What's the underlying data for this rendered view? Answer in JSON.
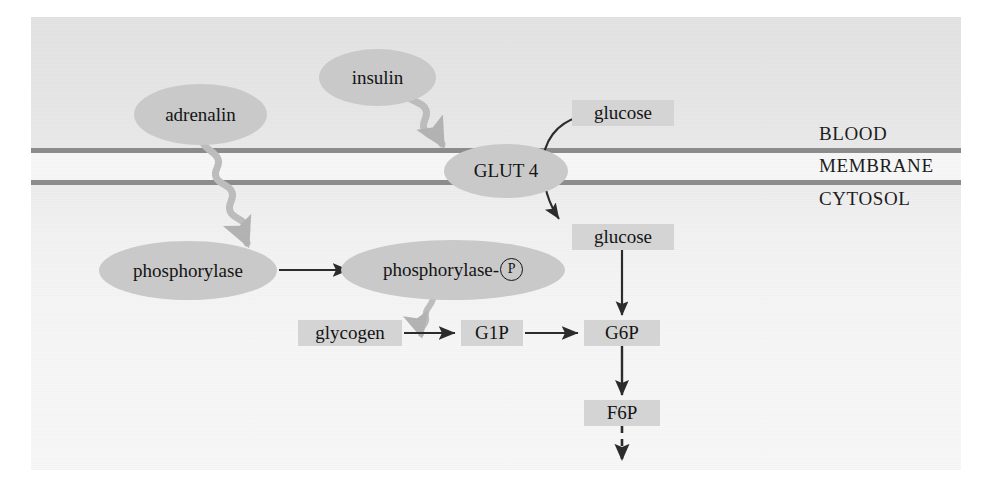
{
  "figure": {
    "type": "biological-pathway-diagram",
    "background_gradient_top": "#e3e3e3",
    "background_gradient_bottom": "#f7f7f7",
    "node_fill": "#c9c9c9",
    "box_fill": "#d4d4d4",
    "membrane_color": "#8c8c8c",
    "text_color": "#141414",
    "wavy_arrow_color": "#bdbdbd",
    "solid_arrow_color": "#2b2b2b"
  },
  "compartments": {
    "blood": "BLOOD",
    "membrane": "MEMBRANE",
    "cytosol": "CYTOSOL"
  },
  "nodes": {
    "adrenalin": "adrenalin",
    "insulin": "insulin",
    "glut4": "GLUT 4",
    "phosphorylase": "phosphorylase",
    "phosphorylase_p_prefix": "phosphorylase-",
    "phosphorylase_p_marker": "P"
  },
  "metabolites": {
    "glucose_blood": "glucose",
    "glucose_cytosol": "glucose",
    "glycogen": "glycogen",
    "g1p": "G1P",
    "g6p": "G6P",
    "f6p": "F6P"
  },
  "edges": [
    {
      "id": "adrenalin-to-phosphorylation",
      "from": "adrenalin",
      "to": "phosphorylase-activation-arrow",
      "style": "wavy",
      "crosses": "membrane"
    },
    {
      "id": "insulin-to-glut4",
      "from": "insulin",
      "to": "glut4",
      "style": "wavy"
    },
    {
      "id": "glucose-transport",
      "from": "glucose_blood",
      "to": "glucose_cytosol",
      "style": "curved-solid",
      "via": "glut4"
    },
    {
      "id": "phosphorylase-activation-arrow",
      "from": "phosphorylase",
      "to": "phosphorylase_p",
      "style": "solid"
    },
    {
      "id": "phosphorylase-p-to-glycogenolysis",
      "from": "phosphorylase_p",
      "to": "glycogen-to-g1p",
      "style": "wavy"
    },
    {
      "id": "glycogen-to-g1p",
      "from": "glycogen",
      "to": "g1p",
      "style": "solid"
    },
    {
      "id": "g1p-to-g6p",
      "from": "g1p",
      "to": "g6p",
      "style": "solid"
    },
    {
      "id": "glucose-cytosol-to-g6p",
      "from": "glucose_cytosol",
      "to": "g6p",
      "style": "solid"
    },
    {
      "id": "g6p-to-f6p",
      "from": "g6p",
      "to": "f6p",
      "style": "solid"
    },
    {
      "id": "f6p-to-glycolysis",
      "from": "f6p",
      "to": "downstream-glycolysis",
      "style": "dashed"
    }
  ]
}
